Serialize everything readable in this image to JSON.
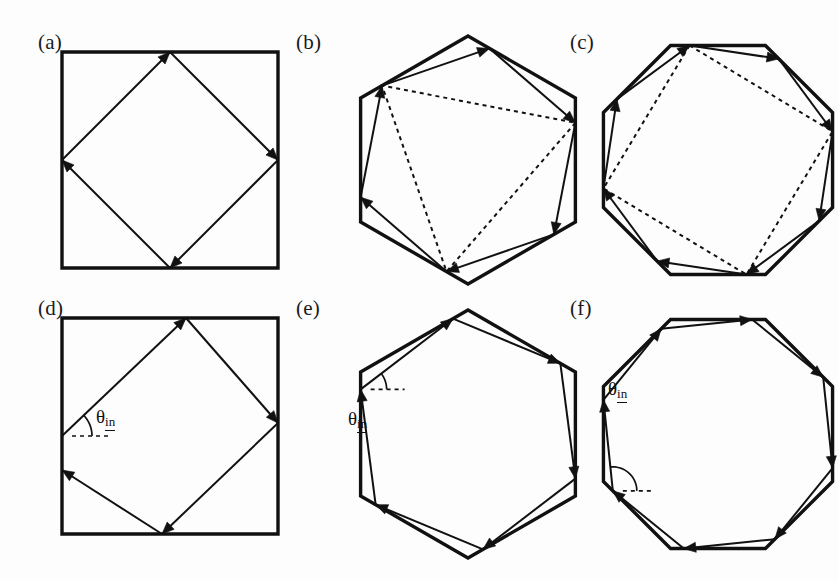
{
  "figure": {
    "background_color": "#fdfdfd",
    "stroke_color": "#111111",
    "width": 838,
    "height": 581
  },
  "panels": [
    {
      "id": "a",
      "label": "(a)",
      "label_x": 38,
      "label_y": 30,
      "cavity": "square",
      "sides": 4,
      "orbit_name": "diamond",
      "orbit_bounces": 4,
      "has_dashed": false,
      "has_theta": false,
      "origin_x": 62,
      "origin_y": 52,
      "size": 216
    },
    {
      "id": "b",
      "label": "(b)",
      "label_x": 296,
      "label_y": 30,
      "cavity": "hexagon",
      "sides": 6,
      "orbit_name": "hexagonal-zigzag",
      "orbit_bounces": 6,
      "has_dashed": true,
      "dashed_name": "triangle",
      "has_theta": false,
      "origin_x": 318,
      "origin_y": 30,
      "size": 248
    },
    {
      "id": "c",
      "label": "(c)",
      "label_x": 570,
      "label_y": 30,
      "cavity": "octagon",
      "sides": 8,
      "orbit_name": "octagonal-zigzag",
      "orbit_bounces": 8,
      "has_dashed": true,
      "dashed_name": "square",
      "has_theta": false,
      "origin_x": 580,
      "origin_y": 30,
      "size": 248
    },
    {
      "id": "d",
      "label": "(d)",
      "label_x": 38,
      "label_y": 296,
      "cavity": "square",
      "sides": 4,
      "orbit_name": "tilted-diamond",
      "orbit_bounces": 4,
      "has_dashed": false,
      "has_theta": true,
      "theta_x": 96,
      "theta_y": 406,
      "origin_x": 62,
      "origin_y": 318,
      "size": 216
    },
    {
      "id": "e",
      "label": "(e)",
      "label_x": 296,
      "label_y": 296,
      "cavity": "hexagon",
      "sides": 6,
      "orbit_name": "whispering-gallery-hexagon",
      "orbit_bounces": 6,
      "has_dashed": false,
      "has_theta": true,
      "theta_x": 348,
      "theta_y": 408,
      "origin_x": 318,
      "origin_y": 296,
      "size": 248
    },
    {
      "id": "f",
      "label": "(f)",
      "label_x": 570,
      "label_y": 296,
      "cavity": "octagon",
      "sides": 8,
      "orbit_name": "whispering-gallery-octagon",
      "orbit_bounces": 8,
      "has_dashed": false,
      "has_theta": true,
      "theta_x": 608,
      "theta_y": 378,
      "origin_x": 580,
      "origin_y": 296,
      "size": 248
    }
  ],
  "annotations": {
    "theta_symbol": "θ",
    "theta_subscript": "in",
    "theta_full": "θin"
  },
  "geometry": {
    "square_a": {
      "boundary": [
        [
          0,
          0
        ],
        [
          216,
          0
        ],
        [
          216,
          216
        ],
        [
          0,
          216
        ]
      ],
      "orbit": [
        [
          108,
          0
        ],
        [
          216,
          108
        ],
        [
          108,
          216
        ],
        [
          0,
          108
        ]
      ],
      "closed": true
    },
    "square_d": {
      "boundary": [
        [
          0,
          0
        ],
        [
          216,
          0
        ],
        [
          216,
          216
        ],
        [
          0,
          216
        ]
      ],
      "orbit": [
        [
          0,
          118
        ],
        [
          124,
          0
        ],
        [
          216,
          105
        ],
        [
          100,
          216
        ],
        [
          0,
          152
        ]
      ],
      "closed": false
    },
    "hexagon_b": {
      "radius": 124,
      "rotation_deg": -90,
      "orbit_offset": 0.2,
      "dashed_indices": [
        1,
        3,
        5
      ]
    },
    "hexagon_e": {
      "radius": 124,
      "rotation_deg": -90,
      "orbit_offset": 0.86
    },
    "octagon_c": {
      "radius": 124,
      "rotation_deg": -112.5,
      "orbit_offset": 0.2,
      "dashed_indices": [
        0,
        2,
        4,
        6
      ]
    },
    "octagon_f": {
      "radius": 124,
      "rotation_deg": -112.5,
      "orbit_offset": 0.86
    }
  },
  "style": {
    "boundary_stroke_width": 3.4,
    "orbit_stroke_width": 2.0,
    "dashed_stroke_width": 2.0,
    "dash_pattern": "4,4",
    "arrow_size": 12
  }
}
